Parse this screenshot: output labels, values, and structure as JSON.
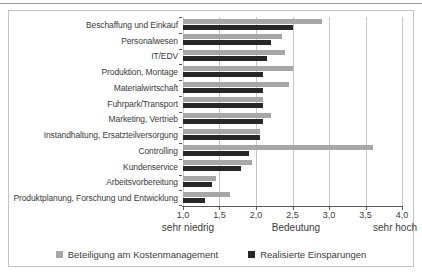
{
  "chart_data": {
    "type": "bar",
    "orientation": "horizontal",
    "title": "",
    "categories": [
      "Beschaffung und Einkauf",
      "Personalwesen",
      "IT/EDV",
      "Produktion, Montage",
      "Materialwirtschaft",
      "Fuhrpark/Transport",
      "Marketing, Vertrieb",
      "Instandhaltung, Ersatzteilversorgung",
      "Controlling",
      "Kundenservice",
      "Arbeitsvorbereitung",
      "Produktplanung, Forschung und Entwicklung"
    ],
    "series": [
      {
        "name": "Beteiligung am Kostenmanagement",
        "color": "#a7a7a7",
        "values": [
          2.9,
          2.35,
          2.4,
          2.5,
          2.45,
          2.1,
          2.2,
          2.05,
          3.6,
          1.95,
          1.45,
          1.65
        ]
      },
      {
        "name": "Realisierte Einsparungen",
        "color": "#272727",
        "values": [
          2.5,
          2.2,
          2.15,
          2.1,
          2.1,
          2.1,
          2.1,
          2.05,
          1.9,
          1.8,
          1.4,
          1.3
        ]
      }
    ],
    "xlabel": "Bedeutung",
    "x_left_label": "sehr niedrig",
    "x_right_label": "sehr hoch",
    "xlim": [
      1.0,
      4.0
    ],
    "xticks": [
      "1,0",
      "1,5",
      "2,0",
      "2,5",
      "3,0",
      "3,5",
      "4,0"
    ],
    "xtick_values": [
      1.0,
      1.5,
      2.0,
      2.5,
      3.0,
      3.5,
      4.0
    ],
    "grid": true,
    "legend_position": "bottom"
  },
  "style": {
    "grid_color": "#c9c9c9",
    "axis_color": "#595959",
    "text_color": "#3b3b3b",
    "frame_border_color": "#c3c3c3",
    "top_rule_color": "#9a9a9a"
  }
}
